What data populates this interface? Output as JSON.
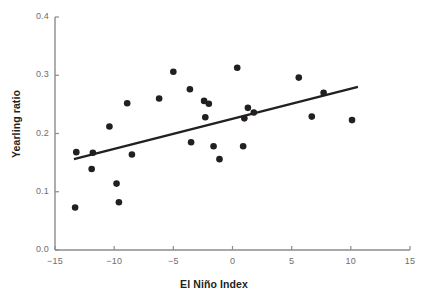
{
  "chart_data": {
    "type": "scatter",
    "title": "",
    "xlabel": "El Niño Index",
    "ylabel": "Yearling ratio",
    "xlim": [
      -15,
      15
    ],
    "ylim": [
      0.0,
      0.4
    ],
    "xticks": [
      -15,
      -10,
      -5,
      0,
      5,
      10,
      15
    ],
    "xtick_labels": [
      "−15",
      "−10",
      "−5",
      "0",
      "5",
      "10",
      "15"
    ],
    "yticks": [
      0.0,
      0.1,
      0.2,
      0.3,
      0.4
    ],
    "ytick_labels": [
      "0.0",
      "0.1",
      "0.2",
      "0.3",
      "0.4"
    ],
    "grid": false,
    "legend": null,
    "series": [
      {
        "name": "Yearling ratio vs El Niño Index",
        "marker": "filled-circle",
        "color": "#231f20",
        "points": [
          {
            "x": -13.3,
            "y": 0.073
          },
          {
            "x": -13.2,
            "y": 0.168
          },
          {
            "x": -11.9,
            "y": 0.139
          },
          {
            "x": -11.8,
            "y": 0.167
          },
          {
            "x": -10.4,
            "y": 0.212
          },
          {
            "x": -9.8,
            "y": 0.114
          },
          {
            "x": -9.6,
            "y": 0.082
          },
          {
            "x": -8.9,
            "y": 0.252
          },
          {
            "x": -8.5,
            "y": 0.164
          },
          {
            "x": -6.2,
            "y": 0.26
          },
          {
            "x": -5.0,
            "y": 0.306
          },
          {
            "x": -3.6,
            "y": 0.276
          },
          {
            "x": -3.5,
            "y": 0.185
          },
          {
            "x": -2.4,
            "y": 0.256
          },
          {
            "x": -2.3,
            "y": 0.228
          },
          {
            "x": -2.0,
            "y": 0.251
          },
          {
            "x": -1.6,
            "y": 0.178
          },
          {
            "x": -1.1,
            "y": 0.156
          },
          {
            "x": 0.4,
            "y": 0.313
          },
          {
            "x": 0.9,
            "y": 0.178
          },
          {
            "x": 1.0,
            "y": 0.226
          },
          {
            "x": 1.3,
            "y": 0.244
          },
          {
            "x": 1.8,
            "y": 0.236
          },
          {
            "x": 5.6,
            "y": 0.296
          },
          {
            "x": 6.7,
            "y": 0.229
          },
          {
            "x": 7.7,
            "y": 0.27
          },
          {
            "x": 10.1,
            "y": 0.223
          }
        ]
      }
    ],
    "trendline": {
      "name": "least-squares fit",
      "color": "#231f20",
      "x_start": -13.4,
      "y_start": 0.156,
      "x_end": 10.6,
      "y_end": 0.28
    },
    "axis_color": "#8c8c8c",
    "tick_label_color": "#6e6e6e",
    "axis_title_color": "#231f20",
    "background": "#ffffff"
  }
}
